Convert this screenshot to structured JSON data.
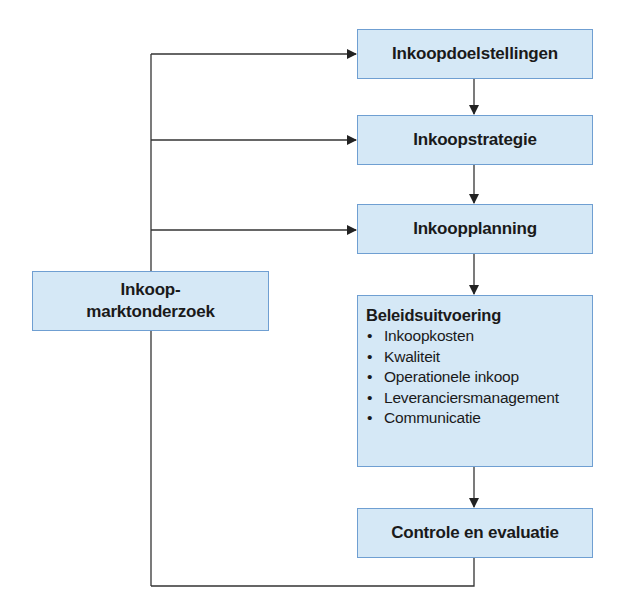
{
  "diagram": {
    "boxes": {
      "doelstellingen": "Inkoopdoelstellingen",
      "strategie": "Inkoopstrategie",
      "planning": "Inkoopplanning",
      "uitvoering": {
        "title": "Beleidsuitvoering",
        "items": [
          "Inkoopkosten",
          "Kwaliteit",
          "Operationele inkoop",
          "Leveranciersmanagement",
          "Communicatie"
        ]
      },
      "controle": "Controle en evaluatie",
      "marktonderzoek": {
        "line1": "Inkoop-",
        "line2": "marktonderzoek"
      }
    },
    "colors": {
      "box_fill": "#d5e8f6",
      "box_border": "#6f9fd2",
      "line": "#333333"
    }
  }
}
